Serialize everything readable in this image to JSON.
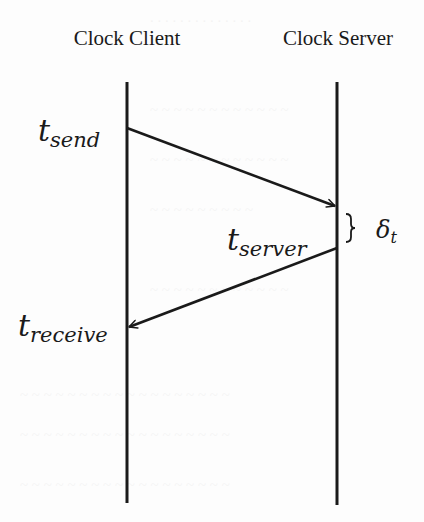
{
  "diagram": {
    "type": "sequence-diagram",
    "participants": [
      {
        "id": "client",
        "label": "Clock Client"
      },
      {
        "id": "server",
        "label": "Clock Server"
      }
    ],
    "messages": [
      {
        "from": "client",
        "to": "server",
        "start_label": {
          "base": "t",
          "sub": "send"
        }
      },
      {
        "from": "server",
        "to": "client",
        "start_label": {
          "base": "t",
          "sub": "server"
        },
        "end_label": {
          "base": "t",
          "sub": "receive"
        }
      }
    ],
    "annotations": {
      "delta": {
        "base": "δ",
        "sub": "t",
        "description": "server processing interval (brace)"
      }
    },
    "colors": {
      "background": "#ffffff",
      "ink": "#1a1a1a"
    }
  }
}
